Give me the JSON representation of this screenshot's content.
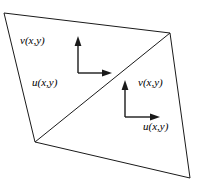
{
  "figure": {
    "background_color": "#ffffff",
    "line_color": "#1a1a1a",
    "width": 198,
    "height": 195
  },
  "shape": {
    "name": "quadrilateral",
    "vertices": [
      {
        "name": "top-left",
        "x": 4,
        "y": 13
      },
      {
        "name": "top-right",
        "x": 170,
        "y": 33
      },
      {
        "name": "bottom-right",
        "x": 190,
        "y": 178
      },
      {
        "name": "bottom-left",
        "x": 35,
        "y": 142
      }
    ],
    "points_attr": "4,13 170,33 190,178 35,142",
    "diagonal": {
      "name": "split-diagonal",
      "x1": 35,
      "y1": 142,
      "x2": 170,
      "y2": 33
    }
  },
  "axes": [
    {
      "id": "upper-left",
      "corner_x": 78,
      "corner_y": 73,
      "vertical": {
        "x1": 78,
        "y1": 73,
        "x2": 78,
        "y2": 42
      },
      "horizontal": {
        "x1": 78,
        "y1": 73,
        "x2": 106,
        "y2": 73
      },
      "arrow_up_points": "78,36 74.6,46 81.4,46",
      "arrow_right_points": "112,73 102,69.6 102,76.4",
      "v_label": {
        "text": "v(x,y)",
        "x": 20,
        "y": 41
      },
      "u_label": {
        "text": "u(x,y)",
        "x": 32,
        "y": 83
      }
    },
    {
      "id": "lower-right",
      "corner_x": 125,
      "corner_y": 117,
      "vertical": {
        "x1": 125,
        "y1": 117,
        "x2": 125,
        "y2": 86
      },
      "horizontal": {
        "x1": 125,
        "y1": 117,
        "x2": 154,
        "y2": 117
      },
      "arrow_up_points": "125,80 121.6,90 128.4,90",
      "arrow_right_points": "160,117 150,113.6 150,120.4",
      "v_label": {
        "text": "v(x,y)",
        "x": 138,
        "y": 83
      },
      "u_label": {
        "text": "u(x,y)",
        "x": 143,
        "y": 127
      }
    }
  ]
}
